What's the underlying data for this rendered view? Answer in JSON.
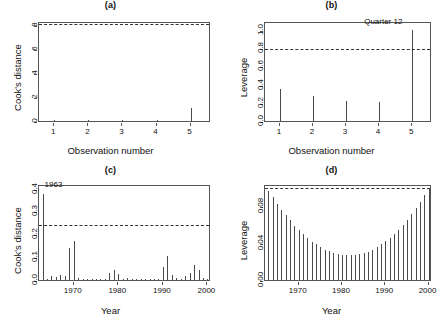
{
  "figure": {
    "width": 442,
    "height": 329,
    "background": "#ffffff",
    "line_color": "#4a4a4a",
    "axis_color": "#555555",
    "threshold_color": "#333333"
  },
  "chart_data": [
    {
      "id": "panel-a",
      "type": "bar",
      "title": "(a)",
      "xlabel": "Observation number",
      "ylabel": "Cook's distance",
      "categories": [
        "1",
        "2",
        "3",
        "4",
        "5"
      ],
      "x": [
        1,
        2,
        3,
        4,
        5
      ],
      "values": [
        0.05,
        0.06,
        0.07,
        0.05,
        1.12
      ],
      "xlim": [
        0.55,
        5.6
      ],
      "ylim": [
        0,
        8.3
      ],
      "xticks": [
        1,
        2,
        3,
        4,
        5
      ],
      "xticklabels": [
        "1",
        "2",
        "3",
        "4",
        "5"
      ],
      "yticks": [
        0,
        2,
        4,
        6,
        8
      ],
      "yticklabels": [
        "0",
        "2",
        "4",
        "6",
        "8"
      ],
      "threshold": 8.0,
      "threshold_style": "dashed",
      "grid": false,
      "legend": "none",
      "annotations": []
    },
    {
      "id": "panel-b",
      "type": "bar",
      "title": "(b)",
      "xlabel": "Observation number",
      "ylabel": "Leverage",
      "categories": [
        "1",
        "2",
        "3",
        "4",
        "5"
      ],
      "x": [
        1,
        2,
        3,
        4,
        5
      ],
      "values": [
        0.35,
        0.27,
        0.225,
        0.205,
        1.0
      ],
      "xlim": [
        0.55,
        5.6
      ],
      "ylim": [
        0,
        1.1
      ],
      "xticks": [
        1,
        2,
        3,
        4,
        5
      ],
      "xticklabels": [
        "1",
        "2",
        "3",
        "4",
        "5"
      ],
      "yticks": [
        0.0,
        0.2,
        0.4,
        0.6,
        0.8,
        1.0
      ],
      "yticklabels": [
        "0.0",
        "0.2",
        "0.4",
        "0.6",
        "0.8",
        "1.0"
      ],
      "threshold": 0.78,
      "threshold_style": "dashed",
      "grid": false,
      "legend": "none",
      "annotations": [
        {
          "text": "Quarter 12",
          "x": 5,
          "y": 1.05,
          "align": "right"
        }
      ]
    },
    {
      "id": "panel-c",
      "type": "bar",
      "title": "(c)",
      "xlabel": "Year",
      "ylabel": "Cook's distance",
      "x": [
        1963,
        1964,
        1965,
        1966,
        1967,
        1968,
        1969,
        1970,
        1971,
        1972,
        1973,
        1974,
        1975,
        1976,
        1977,
        1978,
        1979,
        1980,
        1981,
        1982,
        1983,
        1984,
        1985,
        1986,
        1987,
        1988,
        1989,
        1990,
        1991,
        1992,
        1993,
        1994,
        1995,
        1996,
        1997,
        1998,
        1999,
        2000
      ],
      "values": [
        0.375,
        0.004,
        0.018,
        0.012,
        0.022,
        0.016,
        0.142,
        0.172,
        0.01,
        0.004,
        0.003,
        0.003,
        0.004,
        0.003,
        0.004,
        0.03,
        0.042,
        0.026,
        0.005,
        0.01,
        0.004,
        0.003,
        0.004,
        0.003,
        0.004,
        0.005,
        0.006,
        0.056,
        0.105,
        0.02,
        0.01,
        0.004,
        0.018,
        0.03,
        0.064,
        0.046,
        0.01,
        0.006
      ],
      "xlim": [
        1962.2,
        2000.8
      ],
      "ylim": [
        0,
        0.42
      ],
      "xticks": [
        1970,
        1980,
        1990,
        2000
      ],
      "xticklabels": [
        "1970",
        "1980",
        "1990",
        "2000"
      ],
      "yticks": [
        0.0,
        0.1,
        0.2,
        0.3,
        0.4
      ],
      "yticklabels": [
        "0.0",
        "0.1",
        "0.2",
        "0.3",
        "0.4"
      ],
      "threshold": 0.235,
      "threshold_style": "dashed",
      "grid": false,
      "legend": "none",
      "annotations": [
        {
          "text": "1963",
          "x": 1963,
          "y": 0.4,
          "align": "left"
        }
      ]
    },
    {
      "id": "panel-d",
      "type": "bar",
      "title": "(d)",
      "xlabel": "Year",
      "ylabel": "Leverage",
      "x": [
        1963,
        1964,
        1965,
        1966,
        1967,
        1968,
        1969,
        1970,
        1971,
        1972,
        1973,
        1974,
        1975,
        1976,
        1977,
        1978,
        1979,
        1980,
        1981,
        1982,
        1983,
        1984,
        1985,
        1986,
        1987,
        1988,
        1989,
        1990,
        1991,
        1992,
        1993,
        1994,
        1995,
        1996,
        1997,
        1998,
        1999,
        2000
      ],
      "values": [
        0.0965,
        0.0895,
        0.0825,
        0.076,
        0.07,
        0.0645,
        0.059,
        0.054,
        0.0495,
        0.0455,
        0.0415,
        0.0385,
        0.0355,
        0.033,
        0.031,
        0.0295,
        0.0283,
        0.0276,
        0.0272,
        0.0272,
        0.0274,
        0.028,
        0.0292,
        0.0308,
        0.033,
        0.0355,
        0.0385,
        0.042,
        0.0458,
        0.05,
        0.0545,
        0.0595,
        0.065,
        0.071,
        0.0775,
        0.0845,
        0.092,
        0.0985
      ],
      "xlim": [
        1962.2,
        2000.8
      ],
      "ylim": [
        0,
        0.104
      ],
      "xticks": [
        1970,
        1980,
        1990,
        2000
      ],
      "xticklabels": [
        "1970",
        "1980",
        "1990",
        "2000"
      ],
      "yticks": [
        0.0,
        0.04,
        0.08
      ],
      "yticklabels": [
        "0.00",
        "0.04",
        "0.08"
      ],
      "threshold": 0.0985,
      "threshold_style": "dashed",
      "grid": false,
      "legend": "none",
      "annotations": []
    }
  ]
}
